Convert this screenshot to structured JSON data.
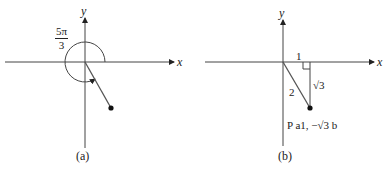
{
  "panels": [
    {
      "id": "a",
      "caption": "(a)",
      "x_axis_label": "x",
      "y_axis_label": "y",
      "angle_label": {
        "numerator": "5π",
        "denominator": "3"
      },
      "description": "Angle of 5π/3 drawn in standard position with a counter-clockwise arc from positive x-axis; terminal side ends at a point in quadrant IV"
    },
    {
      "id": "b",
      "caption": "(b)",
      "x_axis_label": "x",
      "y_axis_label": "y",
      "triangle": {
        "horizontal_leg": "1",
        "vertical_leg": "√3",
        "hypotenuse": "2"
      },
      "point_label": "P a1, −√3 b",
      "description": "Reference triangle with right angle at (1,0); point P(1, −√3)"
    }
  ],
  "colors": {
    "stroke": "#222222",
    "background": "#ffffff"
  }
}
